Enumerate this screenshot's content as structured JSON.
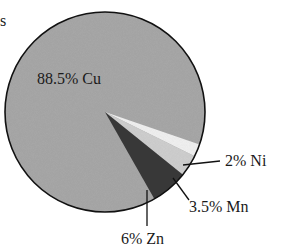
{
  "chart_data": {
    "type": "pie",
    "title": "",
    "slices": [
      {
        "label": "Cu",
        "value": 88.5,
        "display": "88.5% Cu",
        "color": "#a9a9a9"
      },
      {
        "label": "Ni",
        "value": 2,
        "display": "2% Ni",
        "color": "#f2f2f2"
      },
      {
        "label": "Mn",
        "value": 3.5,
        "display": "3.5% Mn",
        "color": "#d0d0d0"
      },
      {
        "label": "Zn",
        "value": 6,
        "display": "6% Zn",
        "color": "#3a3a3a"
      }
    ],
    "legend": "none",
    "annotations": [
      "88.5% Cu",
      "2% Ni",
      "3.5% Mn",
      "6% Zn"
    ]
  },
  "clipped_text": "s",
  "geometry": {
    "cx": 105,
    "cy": 112,
    "r": 100,
    "start_deg": 19
  }
}
